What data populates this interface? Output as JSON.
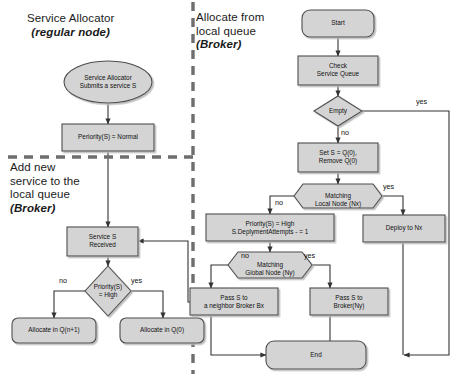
{
  "figure": {
    "type": "flowchart",
    "background": "#ffffff",
    "node_fill": "#d4d4d4",
    "node_stroke": "#4d4d4d",
    "edge_stroke": "#333333",
    "divider_stroke": "#6e6e6e"
  },
  "sections": [
    {
      "id": "service-allocator",
      "line1": "Service Allocator",
      "line2": "(regular node)",
      "emphasis": "regular node"
    },
    {
      "id": "add-new-service",
      "line1": "Add new",
      "line2": "service to the",
      "line3": "local queue",
      "line4": "(Broker)",
      "emphasis": "Broker"
    },
    {
      "id": "allocate-from-local-queue",
      "line1": "Allocate from",
      "line2": "local queue",
      "line3": "(Broker)",
      "emphasis": "Broker"
    }
  ],
  "nodes": {
    "submit": {
      "label": "Service Allocator\nSubmits a service S",
      "shape": "ellipse"
    },
    "priority_normal": {
      "label": "Periority(S) = Normal",
      "shape": "rect"
    },
    "service_received": {
      "label": "Service S\nReceived",
      "shape": "rect"
    },
    "priority_high_q": {
      "label": "Priority(S)\n= High",
      "shape": "diamond"
    },
    "allocate_qn1": {
      "label": "Allocate in Q(n+1)",
      "shape": "rounded"
    },
    "allocate_q0": {
      "label": "Allocate in Q(0)",
      "shape": "rounded"
    },
    "start": {
      "label": "Start",
      "shape": "rounded"
    },
    "check_queue": {
      "label": "Check\nService Queue",
      "shape": "rect"
    },
    "empty_q": {
      "label": "Empty",
      "shape": "diamond"
    },
    "set_s": {
      "label": "Set S = Q(0),\nRemove Q(0)",
      "shape": "rect"
    },
    "matching_local": {
      "label": "Matching\nLocal Node (Nx)",
      "shape": "hexagon"
    },
    "deploy_nx": {
      "label": "Deploy to Nx",
      "shape": "rect"
    },
    "priority_high_set": {
      "label": "Priority(S) = High\nS.DeplymentAttempts - = 1",
      "shape": "rect"
    },
    "matching_global": {
      "label": "Matching\nGlobal Node (Ny)",
      "shape": "hexagon"
    },
    "pass_neighbor": {
      "label": "Pass S to\na neighbor Broker Bx",
      "shape": "rect"
    },
    "pass_broker_ny": {
      "label": "Pass S to\nBroker(Ny)",
      "shape": "rect"
    },
    "end": {
      "label": "End",
      "shape": "rounded"
    }
  },
  "edge_labels": {
    "priority_high_no": "no",
    "priority_high_yes": "yes",
    "empty_yes": "yes",
    "empty_no": "no",
    "local_yes": "yes",
    "local_no": "no",
    "global_no": "no",
    "global_yes": "yes"
  }
}
